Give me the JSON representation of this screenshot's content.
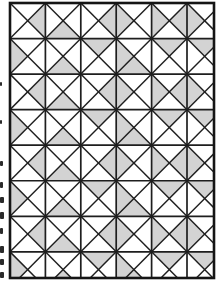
{
  "figure": {
    "name": "quilt-block-pattern",
    "background_color": "#ffffff",
    "cell_fill_color": "#ffffff",
    "shaded_fill_color": "#d3d3d3",
    "line_color": "#1e1e1e",
    "frame_color": "#151515",
    "canvas": {
      "width": 220,
      "height": 288
    },
    "frame": {
      "x": 10,
      "y": 3,
      "width": 204,
      "height": 275
    },
    "grid": {
      "rows": 8,
      "cols": 6,
      "col_edges": [
        10,
        45.4,
        80.8,
        116.2,
        151.6,
        187.0,
        222.4
      ],
      "row_edges": [
        3,
        38.55,
        74.1,
        109.65,
        145.2,
        180.75,
        216.3,
        251.85,
        287.4
      ]
    },
    "cell_division": "both-diagonals-x",
    "row_patterns": [
      "A",
      "B",
      "A",
      "B",
      "A",
      "B",
      "A",
      "B"
    ],
    "shading_by_pattern": {
      "A": [
        [
          "E"
        ],
        [
          "S"
        ],
        [
          "E"
        ],
        [
          "W"
        ],
        [
          "W",
          "E"
        ],
        [
          "W"
        ]
      ],
      "B": [
        [
          "W"
        ],
        [
          "S"
        ],
        [
          "N"
        ],
        [
          "W",
          "S"
        ],
        [
          "N"
        ],
        [
          "N"
        ]
      ]
    },
    "stroke": {
      "diagonal_width": 1.45,
      "grid_width": 1.7,
      "frame_width": 2.6
    }
  },
  "margin_marks": {
    "color": "#2a2a2a",
    "marks": [
      {
        "x": 0,
        "y": 82,
        "w": 2,
        "h": 4
      },
      {
        "x": 0,
        "y": 120,
        "w": 2,
        "h": 4
      },
      {
        "x": 0,
        "y": 161,
        "w": 3,
        "h": 5
      },
      {
        "x": 0,
        "y": 182,
        "w": 3,
        "h": 6
      },
      {
        "x": 0,
        "y": 197,
        "w": 4,
        "h": 6
      },
      {
        "x": 0,
        "y": 212,
        "w": 4,
        "h": 7
      },
      {
        "x": 0,
        "y": 228,
        "w": 3,
        "h": 6
      },
      {
        "x": 0,
        "y": 246,
        "w": 4,
        "h": 7
      },
      {
        "x": 0,
        "y": 259,
        "w": 4,
        "h": 6
      },
      {
        "x": 0,
        "y": 272,
        "w": 4,
        "h": 6
      }
    ]
  }
}
